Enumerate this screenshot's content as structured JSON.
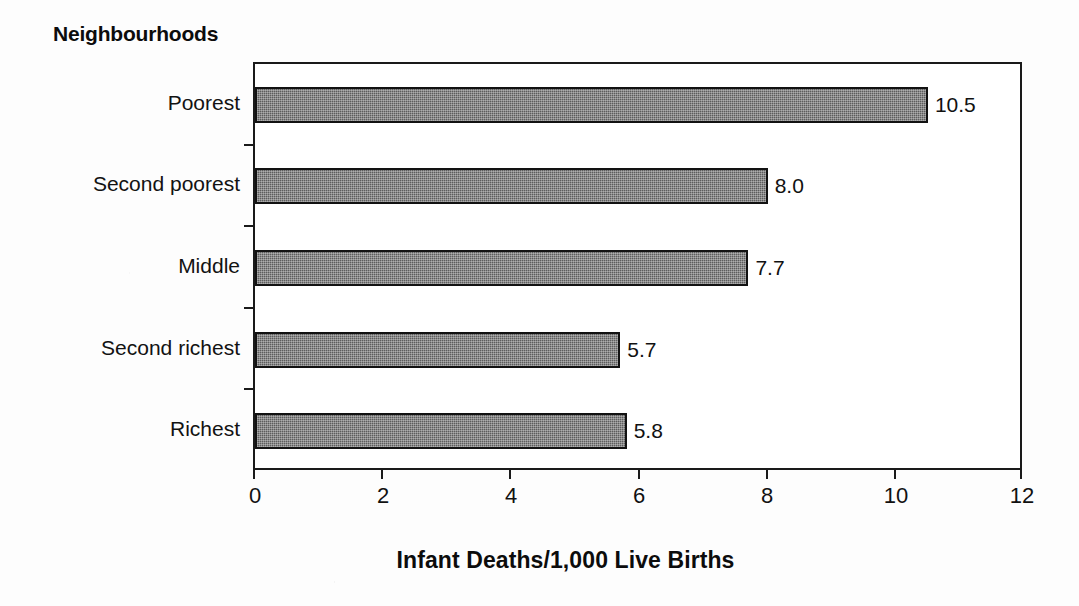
{
  "chart_data": {
    "type": "bar",
    "orientation": "horizontal",
    "title": "Neighbourhoods",
    "xlabel": "Infant Deaths/1,000 Live Births",
    "ylabel": "",
    "categories": [
      "Poorest",
      "Second poorest",
      "Middle",
      "Second richest",
      "Richest"
    ],
    "values": [
      10.5,
      8.0,
      7.7,
      5.7,
      5.8
    ],
    "value_labels": [
      "10.5",
      "8.0",
      "7.7",
      "5.7",
      "5.8"
    ],
    "xlim": [
      0,
      12
    ],
    "xticks": [
      0,
      2,
      4,
      6,
      8,
      10,
      12
    ],
    "xtick_labels": [
      "0",
      "2",
      "4",
      "6",
      "8",
      "10",
      "12"
    ],
    "grid": false,
    "legend": false,
    "bar_color": "#5d5d5d",
    "bar_border_color": "#121212",
    "axis_color": "#1a1a1a",
    "background_color": "#fdfdfd"
  }
}
